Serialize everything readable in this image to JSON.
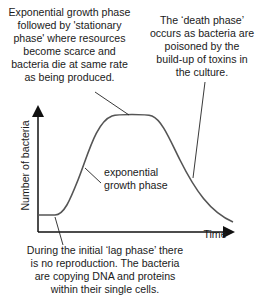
{
  "diagram": {
    "type": "bacterial growth curve",
    "axes": {
      "x_label": "Time",
      "y_label": "Number of bacteria"
    },
    "annotations": {
      "stationary": "Exponential growth phase\nfollowed by 'stationary\nphase' where resources\nbecome scarce and\nbacteria die at same rate\nas being produced.",
      "death": "The ‘death phase’\noccurs as bacteria are\npoisoned by the\nbuild-up of toxins in\nthe culture.",
      "exponential": "exponential\ngrowth phase",
      "lag": "During the initial ‘lag phase’ there\nis no reproduction. The bacteria\nare copying DNA and proteins\nwithin their single cells."
    },
    "phases": [
      "lag phase",
      "exponential growth phase",
      "stationary phase",
      "death phase"
    ],
    "colors": {
      "curve": "#555555",
      "axes": "#111111",
      "text": "#1a1a1a"
    }
  }
}
